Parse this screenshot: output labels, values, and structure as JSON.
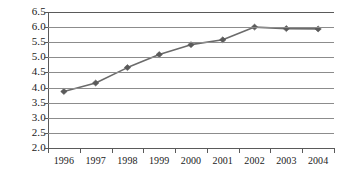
{
  "chart_data": {
    "type": "line",
    "title": "",
    "subtitle": "",
    "xlabel": "",
    "ylabel": "",
    "categories": [
      "1996",
      "1997",
      "1998",
      "1999",
      "2000",
      "2001",
      "2002",
      "2003",
      "2004"
    ],
    "values": [
      3.87,
      4.15,
      4.66,
      5.09,
      5.42,
      5.58,
      6.0,
      5.95,
      5.94
    ],
    "series": [
      {
        "name": "",
        "values": [
          3.87,
          4.15,
          4.66,
          5.09,
          5.42,
          5.58,
          6.0,
          5.95,
          5.94
        ]
      }
    ],
    "ylim": [
      2.0,
      6.5
    ],
    "ytick_labels": [
      "2.0",
      "2.5",
      "3.0",
      "3.5",
      "4.0",
      "4.5",
      "5.0",
      "5.5",
      "6.0",
      "6.5"
    ],
    "ytick_values": [
      2.0,
      2.5,
      3.0,
      3.5,
      4.0,
      4.5,
      5.0,
      5.5,
      6.0,
      6.5
    ],
    "grid": true,
    "grid_axis": "y",
    "legend": false,
    "legend_position": "none",
    "marker": "diamond",
    "line_color": "#6b6b6b",
    "marker_color": "#5a5a5a",
    "grid_color": "#8c8c8c",
    "axis_color": "#5a5a5a",
    "text_color": "#1a1a1a",
    "background_color": "#ffffff",
    "annotations": []
  }
}
